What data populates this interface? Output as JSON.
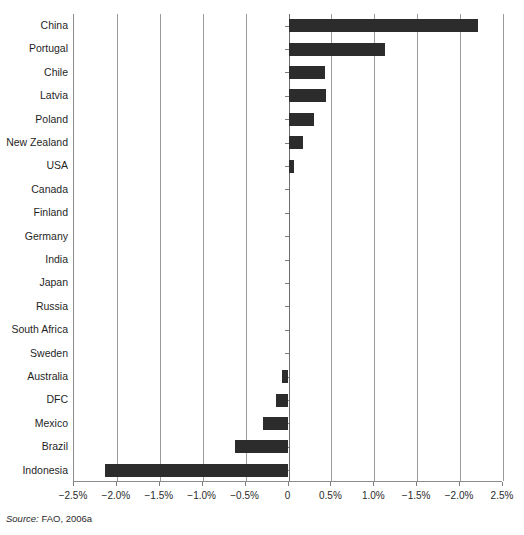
{
  "chart_data": {
    "type": "bar",
    "orientation": "horizontal",
    "title": "",
    "subtitle": "",
    "xlabel": "",
    "ylabel": "",
    "xlim": [
      -2.5,
      2.5
    ],
    "grid": true,
    "legend": null,
    "categories": [
      "China",
      "Portugal",
      "Chile",
      "Latvia",
      "Poland",
      "New Zealand",
      "USA",
      "Canada",
      "Finland",
      "Germany",
      "India",
      "Japan",
      "Russia",
      "South Africa",
      "Sweden",
      "Australia",
      "DFC",
      "Mexico",
      "Brazil",
      "Indonesia"
    ],
    "values": [
      2.21,
      1.13,
      0.42,
      0.44,
      0.3,
      0.17,
      0.06,
      0.0,
      0.0,
      0.0,
      0.0,
      0.0,
      0.0,
      0.0,
      0.0,
      -0.07,
      -0.14,
      -0.3,
      -0.62,
      -2.14
    ],
    "xtick_values": [
      -2.5,
      -2.0,
      -1.5,
      -1.0,
      -0.5,
      0,
      0.5,
      1.0,
      1.5,
      2.0,
      2.5
    ],
    "xtick_labels": [
      "−2.5%",
      "−2.0%",
      "−1.5%",
      "−1.0%",
      "−0.5%",
      "0",
      "0.5%",
      "1.0%",
      "−1.5%",
      "−2.0%",
      "2.5%"
    ],
    "gridline_values": [
      -2.0,
      -1.5,
      -1.0,
      -0.5,
      0,
      0.5,
      1.0,
      1.5,
      2.0,
      2.5
    ],
    "bar_color": "#2c2c2c",
    "grid_color": "#9a9a9a",
    "axis_color": "#8c8c8c"
  },
  "source": {
    "label": "Source:",
    "text": "FAO, 2006a"
  }
}
